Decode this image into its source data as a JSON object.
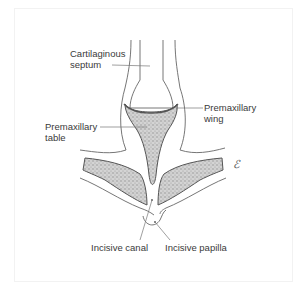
{
  "diagram": {
    "labels": {
      "cartilaginous_septum": {
        "line1": "Cartilaginous",
        "line2": "septum"
      },
      "premaxillary_wing": {
        "line1": "Premaxillary",
        "line2": "wing"
      },
      "premaxillary_table": {
        "line1": "Premaxillary",
        "line2": "table"
      },
      "incisive_canal": "Incisive canal",
      "incisive_papilla": "Incisive papilla"
    },
    "mark_icon": "ℰ",
    "colors": {
      "outline": "#555555",
      "bone_fill": "#b8b8b8",
      "cartilage_fill": "#ffffff",
      "leader_line": "#777777",
      "text": "#3a3a3a"
    }
  }
}
